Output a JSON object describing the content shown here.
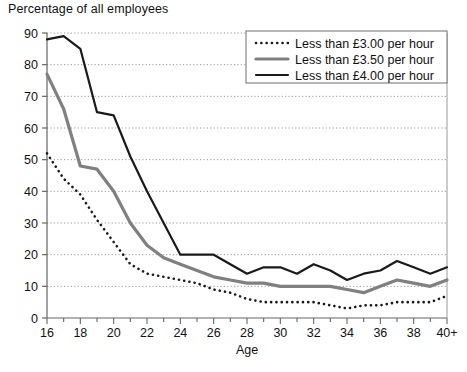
{
  "chart_data": {
    "type": "line",
    "title": "",
    "ylabel": "Percentage of all employees",
    "xlabel": "Age",
    "ylim": [
      0,
      90
    ],
    "xlim": [
      16,
      40
    ],
    "grid": true,
    "grid_style": "dotted horizontal",
    "legend_position": "top-right",
    "y_ticks": [
      0,
      10,
      20,
      30,
      40,
      50,
      60,
      70,
      80,
      90
    ],
    "x_ticks": [
      16,
      17,
      18,
      19,
      20,
      21,
      22,
      23,
      24,
      25,
      26,
      27,
      28,
      29,
      30,
      31,
      32,
      33,
      34,
      35,
      36,
      37,
      38,
      39,
      40
    ],
    "x_tick_labels": [
      "16",
      "",
      "18",
      "",
      "20",
      "",
      "22",
      "",
      "24",
      "",
      "26",
      "",
      "28",
      "",
      "30",
      "",
      "32",
      "",
      "34",
      "",
      "36",
      "",
      "38",
      "",
      "40+"
    ],
    "x": [
      16,
      17,
      18,
      19,
      20,
      21,
      22,
      23,
      24,
      25,
      26,
      27,
      28,
      29,
      30,
      31,
      32,
      33,
      34,
      35,
      36,
      37,
      38,
      39,
      40
    ],
    "series": [
      {
        "name": "Less than £3.00 per hour",
        "style": "dotted",
        "color": "#1a1a1a",
        "values": [
          52,
          44,
          39,
          31,
          24,
          17,
          14,
          13,
          12,
          11,
          9,
          8,
          6,
          5,
          5,
          5,
          5,
          4,
          3,
          4,
          4,
          5,
          5,
          5,
          7
        ]
      },
      {
        "name": "Less than £3.50 per hour",
        "style": "thick-gray",
        "color": "#808080",
        "values": [
          77,
          66,
          48,
          47,
          40,
          30,
          23,
          19,
          17,
          15,
          13,
          12,
          11,
          11,
          10,
          10,
          10,
          10,
          9,
          8,
          10,
          12,
          11,
          10,
          12
        ]
      },
      {
        "name": "Less than £4.00 per hour",
        "style": "thick-black",
        "color": "#1a1a1a",
        "values": [
          88,
          89,
          85,
          65,
          64,
          51,
          40,
          30,
          20,
          20,
          20,
          17,
          14,
          16,
          16,
          14,
          17,
          15,
          12,
          14,
          15,
          18,
          16,
          14,
          16
        ]
      }
    ]
  },
  "legend": {
    "items": [
      {
        "label": "Less than £3.00 per hour",
        "swatch": "dotted"
      },
      {
        "label": "Less than £3.50 per hour",
        "swatch": "thick-gray"
      },
      {
        "label": "Less than £4.00 per hour",
        "swatch": "thick-black"
      }
    ]
  },
  "bottom_text": ""
}
